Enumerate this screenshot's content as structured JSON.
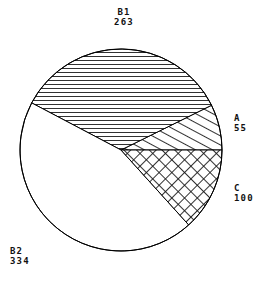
{
  "chart_data": {
    "type": "pie",
    "title": "",
    "subtitle": "",
    "xlabel": "",
    "ylabel": "",
    "grid": false,
    "legend": "none",
    "label_format": "name_over_value",
    "total": 752,
    "start_angle_deg": 0,
    "direction": "counterclockwise",
    "categories": [
      "A",
      "B1",
      "B2",
      "C"
    ],
    "values": [
      55,
      263,
      334,
      100
    ],
    "slices": [
      {
        "name": "A",
        "value": 55,
        "label_name": "A",
        "label_value": "55",
        "percent": 7.3,
        "start_deg": 0.0,
        "end_deg": 26.3,
        "fill": "diagonal-hatch",
        "stroke": "#000000",
        "label_position": "right-upper"
      },
      {
        "name": "B1",
        "value": 263,
        "label_name": "B1",
        "label_value": "263",
        "percent": 35.0,
        "start_deg": 26.3,
        "end_deg": 152.2,
        "fill": "horizontal-hatch",
        "stroke": "#000000",
        "label_position": "top"
      },
      {
        "name": "B2",
        "value": 334,
        "label_name": "B2",
        "label_value": "334",
        "percent": 44.4,
        "start_deg": 152.2,
        "end_deg": 312.1,
        "fill": "none",
        "stroke": "#000000",
        "label_position": "bottom-left"
      },
      {
        "name": "C",
        "value": 100,
        "label_name": "C",
        "label_value": "100",
        "percent": 13.3,
        "start_deg": 312.1,
        "end_deg": 360.0,
        "fill": "cross-hatch",
        "stroke": "#000000",
        "label_position": "right-lower"
      }
    ],
    "colors": {
      "outline": "#000000",
      "background": "#ffffff",
      "hatch": "#1a1a1a",
      "text": "#111111"
    },
    "geometry": {
      "center_x": 121,
      "center_y": 150,
      "radius": 101
    }
  },
  "labels": {
    "B1": {
      "name": "B1",
      "value": "263"
    },
    "A": {
      "name": "A",
      "value": "55"
    },
    "C": {
      "name": "C",
      "value": "100"
    },
    "B2": {
      "name": "B2",
      "value": "334"
    }
  }
}
